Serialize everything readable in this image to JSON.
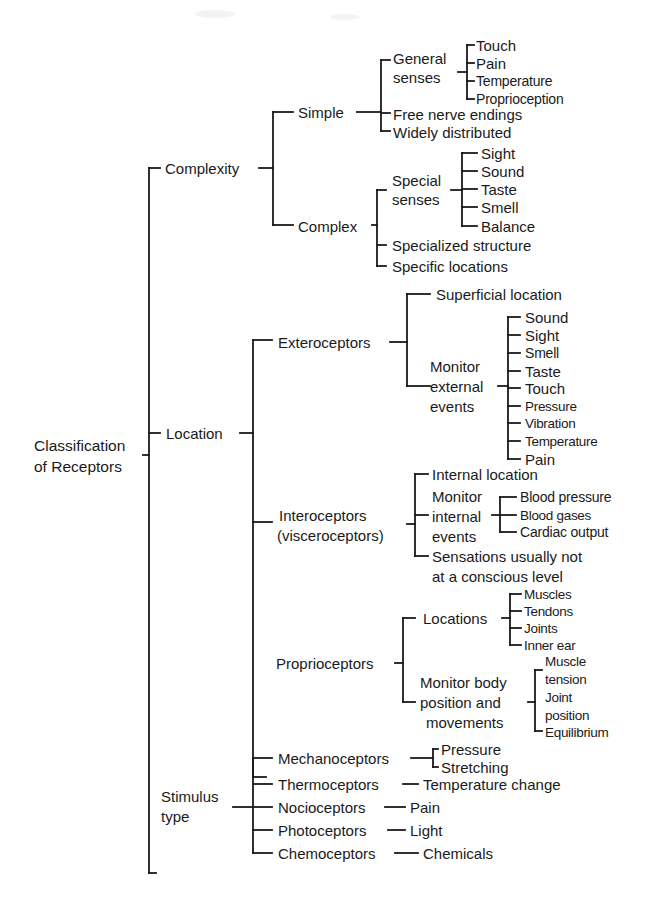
{
  "diagram": {
    "type": "tree",
    "root": {
      "line1": "Classification",
      "line2": "of Receptors"
    },
    "complexity": {
      "label": "Complexity",
      "simple": {
        "label": "Simple",
        "general_senses": {
          "line1": "General",
          "line2": "senses",
          "items": [
            "Touch",
            "Pain",
            "Temperature",
            "Proprioception"
          ]
        },
        "free_nerve_endings": "Free nerve endings",
        "widely_distributed": "Widely distributed"
      },
      "complex": {
        "label": "Complex",
        "special_senses": {
          "line1": "Special",
          "line2": "senses",
          "items": [
            "Sight",
            "Sound",
            "Taste",
            "Smell",
            "Balance"
          ]
        },
        "specialized_structure": "Specialized structure",
        "specific_locations": "Specific locations"
      }
    },
    "location": {
      "label": "Location",
      "exteroceptors": {
        "label": "Exteroceptors",
        "superficial_location": "Superficial location",
        "monitor": {
          "line1": "Monitor",
          "line2": "external",
          "line3": "events",
          "items": [
            "Sound",
            "Sight",
            "Smell",
            "Taste",
            "Touch",
            "Pressure",
            "Vibration",
            "Temperature",
            "Pain"
          ]
        }
      },
      "interoceptors": {
        "line1": "Interoceptors",
        "line2": "(visceroceptors)",
        "internal_location": "Internal location",
        "monitor": {
          "line1": "Monitor",
          "line2": "internal",
          "line3": "events",
          "items": [
            "Blood pressure",
            "Blood gases",
            "Cardiac output"
          ]
        },
        "sensations": {
          "line1": "Sensations usually not",
          "line2": "at a conscious level"
        }
      },
      "proprioceptors": {
        "label": "Proprioceptors",
        "locations": {
          "label": "Locations",
          "items": [
            "Muscles",
            "Tendons",
            "Joints",
            "Inner ear"
          ]
        },
        "monitor": {
          "line1": "Monitor body",
          "line2": "position and",
          "line3": "movements",
          "items": [
            {
              "line1": "Muscle",
              "line2": "tension"
            },
            {
              "line1": "Joint",
              "line2": "position"
            },
            {
              "line1": "Equilibrium"
            }
          ]
        }
      }
    },
    "stimulus_type": {
      "line1": "Stimulus",
      "line2": "type",
      "mechanoceptors": {
        "label": "Mechanoceptors",
        "items": [
          "Pressure",
          "Stretching"
        ]
      },
      "thermoceptors": {
        "label": "Thermoceptors",
        "target": "Temperature change"
      },
      "nocioceptors": {
        "label": "Nocioceptors",
        "target": "Pain"
      },
      "photoceptors": {
        "label": "Photoceptors",
        "target": "Light"
      },
      "chemoceptors": {
        "label": "Chemoceptors",
        "target": "Chemicals"
      }
    }
  },
  "colors": {
    "ink": "#1a1a1a",
    "paper": "#ffffff"
  }
}
